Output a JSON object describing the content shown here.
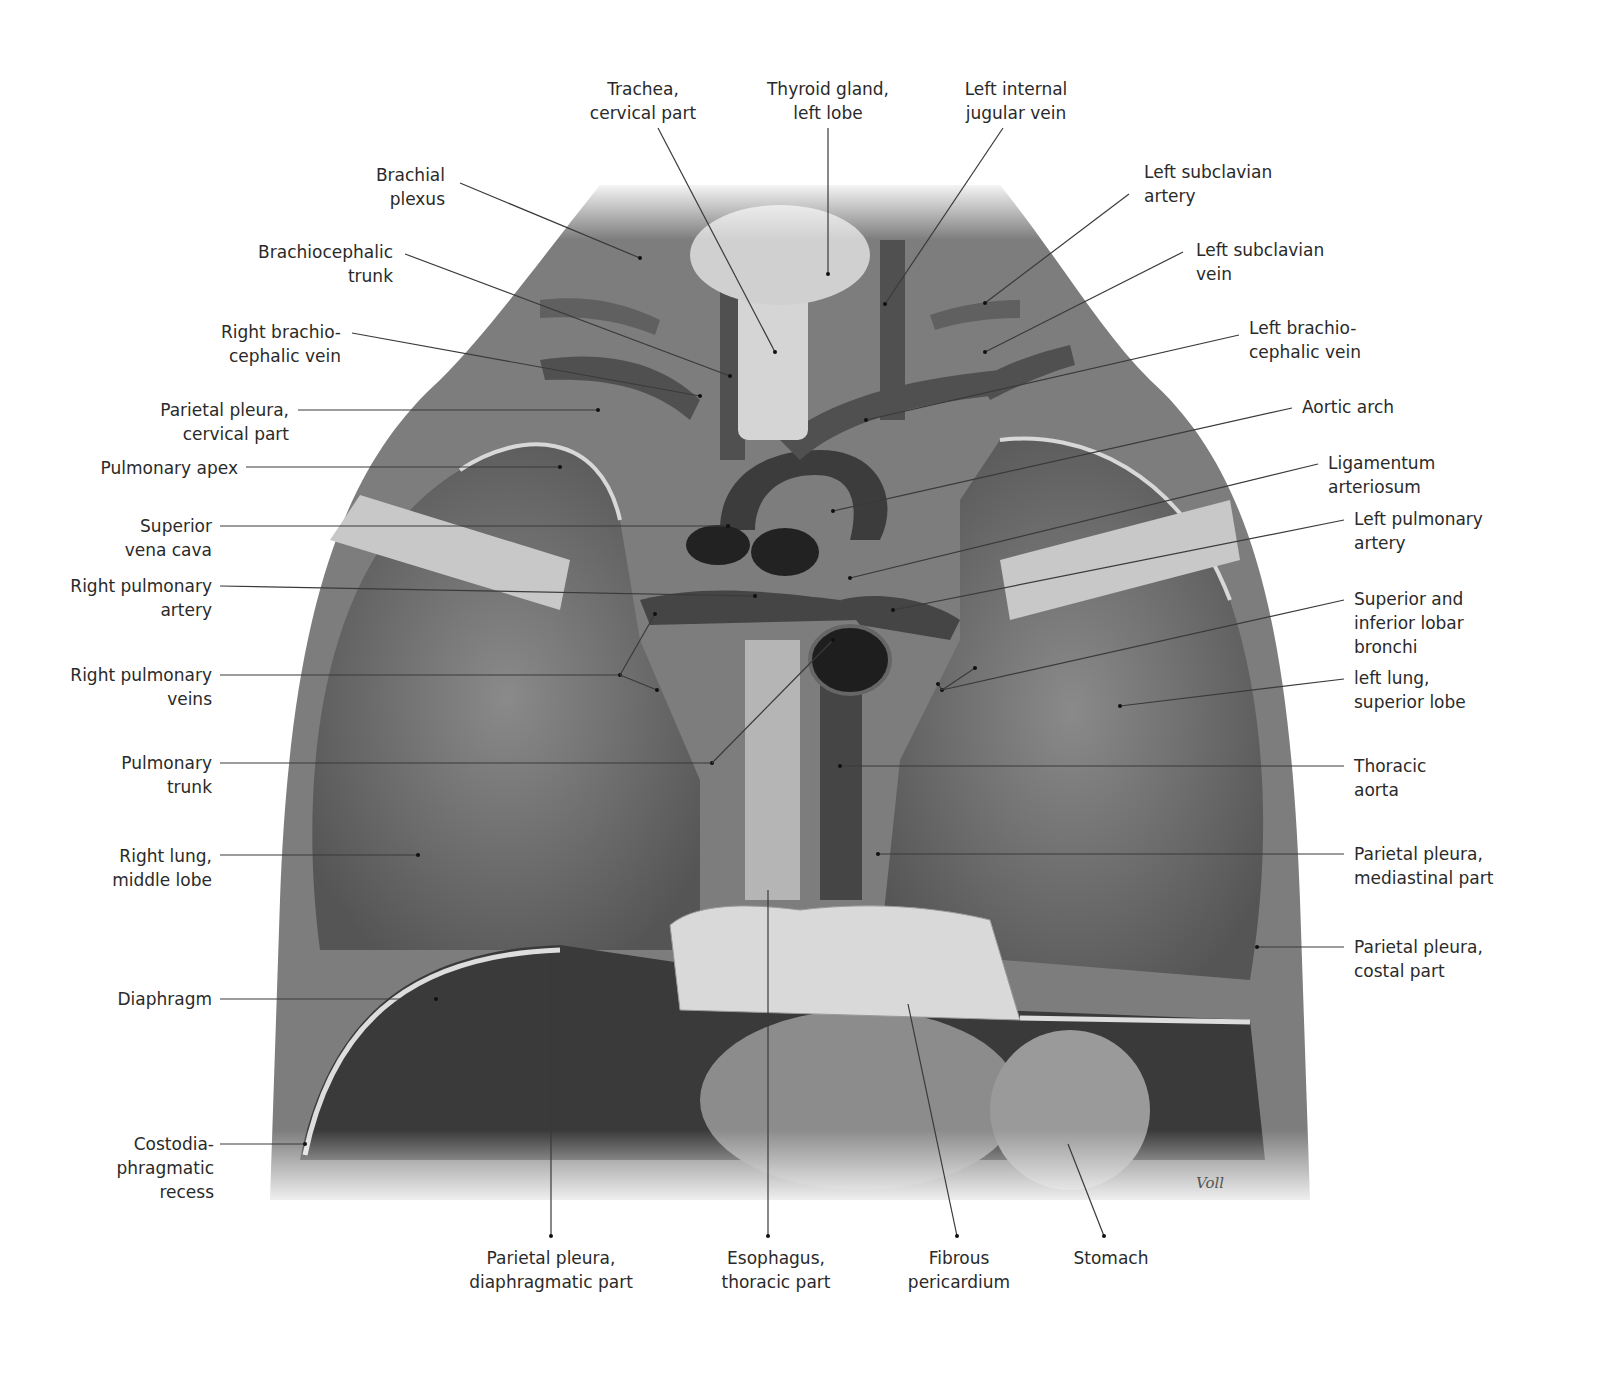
{
  "figure": {
    "signature": "Voll",
    "labels_left": [
      {
        "id": "brachial-plexus",
        "text": "Brachial\nplexus",
        "x": 445,
        "y": 163
      },
      {
        "id": "brachiocephalic-trunk",
        "text": "Brachiocephalic\ntrunk",
        "x": 393,
        "y": 240
      },
      {
        "id": "right-brachiocephalic-vein",
        "text": "Right brachio-\ncephalic vein",
        "x": 341,
        "y": 320
      },
      {
        "id": "parietal-pleura-cervical",
        "text": "Parietal pleura,\ncervical part",
        "x": 289,
        "y": 398
      },
      {
        "id": "pulmonary-apex",
        "text": "Pulmonary apex",
        "x": 238,
        "y": 456
      },
      {
        "id": "superior-vena-cava",
        "text": "Superior\nvena cava",
        "x": 212,
        "y": 514
      },
      {
        "id": "right-pulmonary-artery",
        "text": "Right pulmonary\nartery",
        "x": 212,
        "y": 574
      },
      {
        "id": "right-pulmonary-veins",
        "text": "Right pulmonary\nveins",
        "x": 212,
        "y": 663
      },
      {
        "id": "pulmonary-trunk",
        "text": "Pulmonary\ntrunk",
        "x": 212,
        "y": 751
      },
      {
        "id": "right-lung-middle-lobe",
        "text": "Right lung,\nmiddle lobe",
        "x": 212,
        "y": 844
      },
      {
        "id": "diaphragm",
        "text": "Diaphragm",
        "x": 212,
        "y": 987
      },
      {
        "id": "costodiaphragmatic-recess",
        "text": "Costodia-\nphragmatic\nrecess",
        "x": 214,
        "y": 1132
      }
    ],
    "labels_right": [
      {
        "id": "left-subclavian-artery",
        "text": "Left subclavian\nartery",
        "x": 1144,
        "y": 160
      },
      {
        "id": "left-subclavian-vein",
        "text": "Left subclavian\nvein",
        "x": 1196,
        "y": 238
      },
      {
        "id": "left-brachiocephalic-vein",
        "text": "Left brachio-\ncephalic vein",
        "x": 1249,
        "y": 316
      },
      {
        "id": "aortic-arch",
        "text": "Aortic arch",
        "x": 1302,
        "y": 395
      },
      {
        "id": "ligamentum-arteriosum",
        "text": "Ligamentum\narteriosum",
        "x": 1328,
        "y": 451
      },
      {
        "id": "left-pulmonary-artery",
        "text": "Left pulmonary\nartery",
        "x": 1354,
        "y": 507
      },
      {
        "id": "lobar-bronchi",
        "text": "Superior and\ninferior lobar\nbronchi",
        "x": 1354,
        "y": 587
      },
      {
        "id": "left-lung-superior-lobe",
        "text": "left lung,\nsuperior lobe",
        "x": 1354,
        "y": 666
      },
      {
        "id": "thoracic-aorta",
        "text": "Thoracic\naorta",
        "x": 1354,
        "y": 754
      },
      {
        "id": "parietal-pleura-mediastinal",
        "text": "Parietal pleura,\nmediastinal part",
        "x": 1354,
        "y": 842
      },
      {
        "id": "parietal-pleura-costal",
        "text": "Parietal pleura,\ncostal part",
        "x": 1354,
        "y": 935
      }
    ],
    "labels_top": [
      {
        "id": "trachea-cervical",
        "text": "Trachea,\ncervical part",
        "x": 643,
        "y": 77
      },
      {
        "id": "thyroid-left-lobe",
        "text": "Thyroid gland,\nleft lobe",
        "x": 828,
        "y": 77
      },
      {
        "id": "left-internal-jugular",
        "text": "Left internal\njugular vein",
        "x": 1016,
        "y": 77
      }
    ],
    "labels_bottom": [
      {
        "id": "parietal-pleura-diaphragmatic",
        "text": "Parietal pleura,\ndiaphragmatic part",
        "x": 551,
        "y": 1246
      },
      {
        "id": "esophagus-thoracic",
        "text": "Esophagus,\nthoracic part",
        "x": 776,
        "y": 1246
      },
      {
        "id": "fibrous-pericardium",
        "text": "Fibrous\npericardium",
        "x": 959,
        "y": 1246
      },
      {
        "id": "stomach",
        "text": "Stomach",
        "x": 1111,
        "y": 1246
      }
    ],
    "leaders": [
      [
        460,
        183,
        640,
        258
      ],
      [
        405,
        254,
        730,
        376
      ],
      [
        352,
        333,
        700,
        396
      ],
      [
        298,
        410,
        598,
        410
      ],
      [
        246,
        467,
        560,
        467
      ],
      [
        220,
        526,
        728,
        526
      ],
      [
        220,
        586,
        755,
        596
      ],
      [
        220,
        675,
        620,
        675
      ],
      [
        220,
        763,
        712,
        763
      ],
      [
        220,
        855,
        418,
        855
      ],
      [
        220,
        999,
        436,
        999
      ],
      [
        220,
        1144,
        305,
        1144
      ],
      [
        1129,
        194,
        985,
        303
      ],
      [
        1183,
        252,
        985,
        352
      ],
      [
        1239,
        335,
        866,
        420
      ],
      [
        1292,
        408,
        833,
        511
      ],
      [
        1318,
        464,
        850,
        578
      ],
      [
        1344,
        520,
        893,
        610
      ],
      [
        1344,
        600,
        942,
        690
      ],
      [
        1344,
        679,
        1120,
        706
      ],
      [
        1344,
        766,
        840,
        766
      ],
      [
        1344,
        854,
        878,
        854
      ],
      [
        1344,
        947,
        1257,
        947
      ],
      [
        658,
        128,
        775,
        352
      ],
      [
        828,
        128,
        828,
        274
      ],
      [
        1003,
        128,
        885,
        304
      ],
      [
        551,
        955,
        551,
        1236
      ],
      [
        768,
        890,
        768,
        1236
      ],
      [
        908,
        1004,
        957,
        1236
      ],
      [
        1068,
        1144,
        1104,
        1236
      ],
      [
        712,
        763,
        833,
        640
      ],
      [
        620,
        675,
        655,
        614
      ],
      [
        620,
        675,
        657,
        690
      ],
      [
        942,
        690,
        975,
        668
      ],
      [
        942,
        690,
        938,
        684
      ]
    ]
  }
}
